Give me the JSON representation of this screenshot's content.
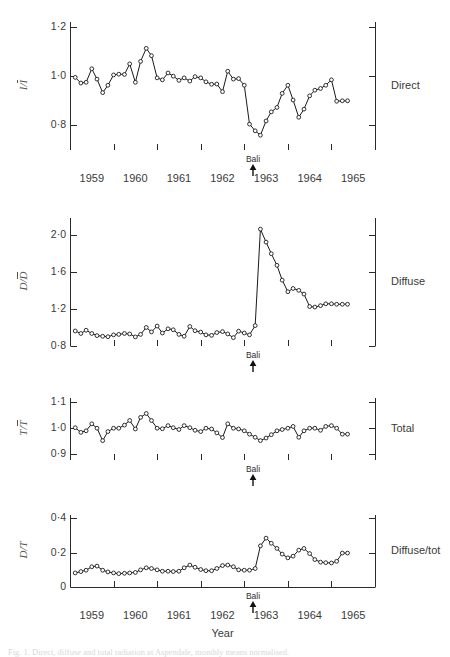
{
  "figure": {
    "caption": "Fig. 1.  Direct, diffuse and total radiation at Aspendale, monthly means normalised.",
    "xaxis": {
      "label": "Year",
      "ticks": [
        "1959",
        "1960",
        "1961",
        "1962",
        "1963",
        "1964",
        "1965"
      ],
      "range": [
        1958.5,
        1965.5
      ]
    },
    "annotation": {
      "label": "Bali",
      "year": 1962.7
    }
  },
  "chart_data": [
    {
      "type": "line",
      "panel_index": 0,
      "right_label": "Direct",
      "ylabel": "I/Ī",
      "ylabel_num": "I",
      "ylabel_den": "I",
      "ylim": [
        0.7,
        1.22
      ],
      "yticks": [
        {
          "value": 1.2,
          "label": "1·2"
        },
        {
          "value": 1.0,
          "label": "1·0"
        },
        {
          "value": 0.8,
          "label": "0·8"
        }
      ],
      "xlabel": "",
      "grid": false,
      "x": [
        1958.62,
        1958.75,
        1958.87,
        1959.0,
        1959.12,
        1959.25,
        1959.37,
        1959.5,
        1959.62,
        1959.75,
        1959.87,
        1960.0,
        1960.12,
        1960.25,
        1960.37,
        1960.5,
        1960.62,
        1960.75,
        1960.87,
        1961.0,
        1961.12,
        1961.25,
        1961.37,
        1961.5,
        1961.62,
        1961.75,
        1961.87,
        1962.0,
        1962.12,
        1962.25,
        1962.37,
        1962.5,
        1962.62,
        1962.75,
        1962.87,
        1963.0,
        1963.12,
        1963.25,
        1963.37,
        1963.5,
        1963.62,
        1963.75,
        1963.87,
        1964.0,
        1964.12,
        1964.25,
        1964.37,
        1964.5,
        1964.62,
        1964.75,
        1964.87
      ],
      "y": [
        0.995,
        0.972,
        0.975,
        1.03,
        0.988,
        0.933,
        0.963,
        1.005,
        1.008,
        1.007,
        1.05,
        0.975,
        1.06,
        1.113,
        1.083,
        0.993,
        0.985,
        1.013,
        1.0,
        0.983,
        0.993,
        0.98,
        0.998,
        0.993,
        0.977,
        0.967,
        0.968,
        0.937,
        1.02,
        0.988,
        0.99,
        0.963,
        0.805,
        0.778,
        0.76,
        0.818,
        0.855,
        0.873,
        0.93,
        0.963,
        0.903,
        0.833,
        0.866,
        0.92,
        0.943,
        0.95,
        0.963,
        0.985,
        0.898,
        0.9,
        0.9
      ]
    },
    {
      "type": "line",
      "panel_index": 1,
      "right_label": "Diffuse",
      "ylabel": "D/D̄",
      "ylabel_num": "D",
      "ylabel_den": "D",
      "ylim": [
        0.8,
        2.18
      ],
      "yticks": [
        {
          "value": 2.0,
          "label": "2·0"
        },
        {
          "value": 1.6,
          "label": "1·6"
        },
        {
          "value": 1.2,
          "label": "1·2"
        },
        {
          "value": 0.8,
          "label": "0·8"
        }
      ],
      "xlabel": "",
      "grid": false,
      "x": [
        1958.62,
        1958.75,
        1958.87,
        1959.0,
        1959.12,
        1959.25,
        1959.37,
        1959.5,
        1959.62,
        1959.75,
        1959.87,
        1960.0,
        1960.12,
        1960.25,
        1960.37,
        1960.5,
        1960.62,
        1960.75,
        1960.87,
        1961.0,
        1961.12,
        1961.25,
        1961.37,
        1961.5,
        1961.62,
        1961.75,
        1961.87,
        1962.0,
        1962.12,
        1962.25,
        1962.37,
        1962.5,
        1962.62,
        1962.75,
        1962.87,
        1963.0,
        1963.12,
        1963.25,
        1963.37,
        1963.5,
        1963.62,
        1963.75,
        1963.87,
        1964.0,
        1964.12,
        1964.25,
        1964.37,
        1964.5,
        1964.62,
        1964.75,
        1964.87
      ],
      "y": [
        0.962,
        0.935,
        0.97,
        0.935,
        0.912,
        0.905,
        0.9,
        0.92,
        0.925,
        0.935,
        0.93,
        0.898,
        0.925,
        1.0,
        0.952,
        1.015,
        0.94,
        0.985,
        0.975,
        0.925,
        0.905,
        1.01,
        0.965,
        0.95,
        0.92,
        0.915,
        0.945,
        0.955,
        0.93,
        0.89,
        0.96,
        0.94,
        0.92,
        1.02,
        2.06,
        1.92,
        1.795,
        1.67,
        1.51,
        1.385,
        1.42,
        1.4,
        1.36,
        1.225,
        1.22,
        1.235,
        1.255,
        1.255,
        1.25,
        1.25,
        1.25
      ]
    },
    {
      "type": "line",
      "panel_index": 2,
      "right_label": "Total",
      "ylabel": "T/T̄",
      "ylabel_num": "T",
      "ylabel_den": "T",
      "ylim": [
        0.875,
        1.115
      ],
      "yticks": [
        {
          "value": 1.1,
          "label": "1·1"
        },
        {
          "value": 1.0,
          "label": "1·0"
        },
        {
          "value": 0.9,
          "label": "0·9"
        }
      ],
      "xlabel": "",
      "grid": false,
      "x": [
        1958.62,
        1958.75,
        1958.87,
        1959.0,
        1959.12,
        1959.25,
        1959.37,
        1959.5,
        1959.62,
        1959.75,
        1959.87,
        1960.0,
        1960.12,
        1960.25,
        1960.37,
        1960.5,
        1960.62,
        1960.75,
        1960.87,
        1961.0,
        1961.12,
        1961.25,
        1961.37,
        1961.5,
        1961.62,
        1961.75,
        1961.87,
        1962.0,
        1962.12,
        1962.25,
        1962.37,
        1962.5,
        1962.62,
        1962.75,
        1962.87,
        1963.0,
        1963.12,
        1963.25,
        1963.37,
        1963.5,
        1963.62,
        1963.75,
        1963.87,
        1964.0,
        1964.12,
        1964.25,
        1964.37,
        1964.5,
        1964.62,
        1964.75,
        1964.87
      ],
      "y": [
        1.0,
        0.982,
        0.988,
        1.015,
        0.998,
        0.95,
        0.985,
        0.998,
        0.998,
        1.01,
        1.028,
        0.995,
        1.04,
        1.055,
        1.028,
        0.998,
        0.996,
        1.008,
        1.0,
        0.993,
        1.008,
        1.0,
        0.99,
        0.985,
        0.998,
        0.995,
        0.98,
        0.962,
        1.015,
        0.998,
        0.995,
        0.988,
        0.975,
        0.963,
        0.95,
        0.96,
        0.973,
        0.988,
        0.993,
        0.998,
        1.005,
        0.963,
        0.988,
        0.998,
        0.998,
        0.99,
        1.005,
        1.008,
        0.998,
        0.975,
        0.975
      ]
    },
    {
      "type": "line",
      "panel_index": 3,
      "right_label": "Diffuse/tot",
      "ylabel": "D/T",
      "ylabel_num": "D",
      "ylabel_den": "",
      "ylim": [
        0.0,
        0.42
      ],
      "yticks": [
        {
          "value": 0.4,
          "label": "0·4"
        },
        {
          "value": 0.2,
          "label": "0·2"
        },
        {
          "value": 0.0,
          "label": "0"
        }
      ],
      "xlabel": "Year",
      "grid": false,
      "x": [
        1958.62,
        1958.75,
        1958.87,
        1959.0,
        1959.12,
        1959.25,
        1959.37,
        1959.5,
        1959.62,
        1959.75,
        1959.87,
        1960.0,
        1960.12,
        1960.25,
        1960.37,
        1960.5,
        1960.62,
        1960.75,
        1960.87,
        1961.0,
        1961.12,
        1961.25,
        1961.37,
        1961.5,
        1961.62,
        1961.75,
        1961.87,
        1962.0,
        1962.12,
        1962.25,
        1962.37,
        1962.5,
        1962.62,
        1962.75,
        1962.87,
        1963.0,
        1963.12,
        1963.25,
        1963.37,
        1963.5,
        1963.62,
        1963.75,
        1963.87,
        1964.0,
        1964.12,
        1964.25,
        1964.37,
        1964.5,
        1964.62,
        1964.75,
        1964.87
      ],
      "y": [
        0.082,
        0.09,
        0.098,
        0.118,
        0.122,
        0.098,
        0.088,
        0.082,
        0.078,
        0.08,
        0.082,
        0.085,
        0.1,
        0.112,
        0.108,
        0.1,
        0.092,
        0.092,
        0.09,
        0.092,
        0.112,
        0.128,
        0.115,
        0.102,
        0.095,
        0.095,
        0.108,
        0.125,
        0.128,
        0.118,
        0.1,
        0.098,
        0.098,
        0.108,
        0.24,
        0.285,
        0.255,
        0.225,
        0.192,
        0.17,
        0.18,
        0.215,
        0.225,
        0.195,
        0.16,
        0.145,
        0.142,
        0.14,
        0.15,
        0.198,
        0.198
      ]
    }
  ]
}
